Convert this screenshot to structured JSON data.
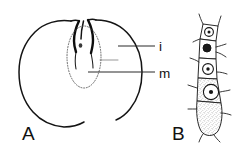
{
  "figure": {
    "kind": "scientific-line-drawing",
    "background_color": "#ffffff",
    "ink_color": "#111111",
    "panels": [
      {
        "id": "A",
        "label": "A",
        "label_x": 22,
        "label_y": 140,
        "subject": "ovule in longitudinal section",
        "callouts": [
          {
            "id": "i",
            "label": "i",
            "meaning": "integument",
            "text_x": 159,
            "text_y": 51,
            "leader_x1": 118,
            "leader_x2": 155,
            "leader_y": 46
          },
          {
            "id": "m",
            "label": "m",
            "meaning": "megaspore",
            "text_x": 159,
            "text_y": 78,
            "leader_x1": 88,
            "leader_x2": 155,
            "leader_y": 72
          }
        ]
      },
      {
        "id": "B",
        "label": "B",
        "label_x": 172,
        "label_y": 140,
        "subject": "filament of cells with nuclei and spines",
        "callouts": []
      }
    ]
  }
}
